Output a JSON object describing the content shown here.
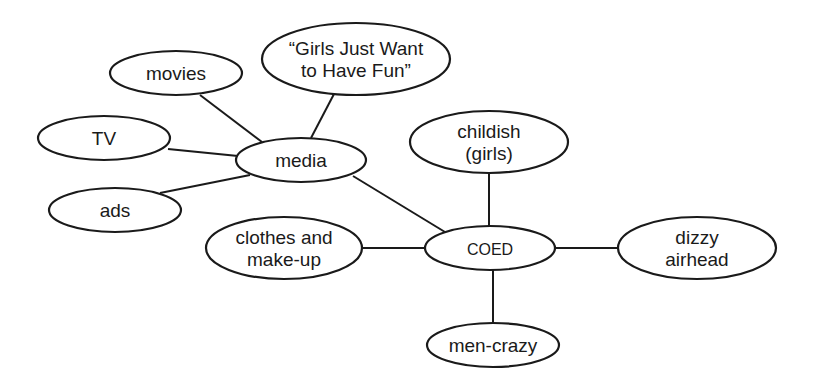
{
  "diagram": {
    "type": "concept-map",
    "central_node": "COED",
    "nodes": {
      "movies": {
        "lines": [
          "movies"
        ],
        "cx": 176,
        "cy": 73,
        "rx": 66,
        "ry": 22
      },
      "girls": {
        "lines": [
          "“Girls Just Want",
          "to Have Fun”"
        ],
        "cx": 356,
        "cy": 59,
        "rx": 94,
        "ry": 36
      },
      "tv": {
        "lines": [
          "TV"
        ],
        "cx": 104,
        "cy": 138,
        "rx": 66,
        "ry": 22
      },
      "media": {
        "lines": [
          "media"
        ],
        "cx": 301,
        "cy": 160,
        "rx": 65,
        "ry": 22
      },
      "ads": {
        "lines": [
          "ads"
        ],
        "cx": 115,
        "cy": 210,
        "rx": 66,
        "ry": 22
      },
      "childish": {
        "lines": [
          "childish",
          "(girls)"
        ],
        "cx": 489,
        "cy": 142,
        "rx": 79,
        "ry": 31
      },
      "clothes": {
        "lines": [
          "clothes and",
          "make-up"
        ],
        "cx": 284,
        "cy": 248,
        "rx": 78,
        "ry": 31
      },
      "coed": {
        "lines": [
          "COED"
        ],
        "cx": 490,
        "cy": 248,
        "rx": 65,
        "ry": 22
      },
      "dizzy": {
        "lines": [
          "dizzy",
          "airhead"
        ],
        "cx": 697,
        "cy": 248,
        "rx": 79,
        "ry": 31
      },
      "mencrazy": {
        "lines": [
          "men-crazy"
        ],
        "cx": 493,
        "cy": 345,
        "rx": 66,
        "ry": 22
      }
    },
    "edges": [
      {
        "from": "movies",
        "to": "media",
        "x1": 200,
        "y1": 95,
        "x2": 262,
        "y2": 142
      },
      {
        "from": "girls",
        "to": "media",
        "x1": 334,
        "y1": 94,
        "x2": 311,
        "y2": 138
      },
      {
        "from": "tv",
        "to": "media",
        "x1": 168,
        "y1": 149,
        "x2": 238,
        "y2": 156
      },
      {
        "from": "ads",
        "to": "media",
        "x1": 160,
        "y1": 193,
        "x2": 250,
        "y2": 175
      },
      {
        "from": "media",
        "to": "coed",
        "x1": 353,
        "y1": 176,
        "x2": 445,
        "y2": 232
      },
      {
        "from": "clothes",
        "to": "coed",
        "x1": 362,
        "y1": 248,
        "x2": 425,
        "y2": 248
      },
      {
        "from": "childish",
        "to": "coed",
        "x1": 489,
        "y1": 173,
        "x2": 489,
        "y2": 226
      },
      {
        "from": "coed",
        "to": "dizzy",
        "x1": 555,
        "y1": 248,
        "x2": 618,
        "y2": 248
      },
      {
        "from": "coed",
        "to": "mencrazy",
        "x1": 493,
        "y1": 270,
        "x2": 493,
        "y2": 323
      }
    ]
  },
  "colors": {
    "background": "#ffffff",
    "stroke": "#1a1a1a",
    "text": "#1a1a1a"
  }
}
